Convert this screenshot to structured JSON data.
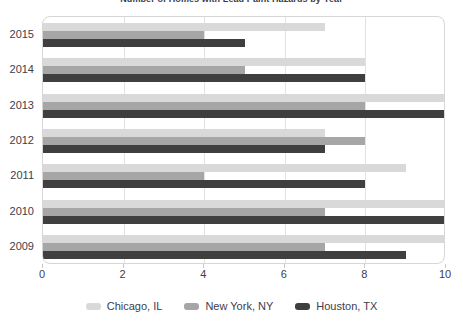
{
  "chart_data": {
    "type": "bar",
    "orientation": "horizontal",
    "title": "Number of Homes with Lead Paint Hazards by Year",
    "xlabel": "",
    "ylabel": "",
    "categories": [
      "2015",
      "2014",
      "2013",
      "2012",
      "2011",
      "2010",
      "2009"
    ],
    "series": [
      {
        "name": "Chicago, IL",
        "color": "#d9d9d9",
        "values": [
          7,
          8,
          10,
          7,
          9,
          10,
          10
        ]
      },
      {
        "name": "New York, NY",
        "color": "#a6a6a6",
        "values": [
          4,
          5,
          8,
          8,
          4,
          7,
          7
        ]
      },
      {
        "name": "Houston, TX",
        "color": "#3f3f3f",
        "values": [
          5,
          8,
          10,
          7,
          8,
          10,
          9
        ]
      }
    ],
    "xlim": [
      0,
      10
    ],
    "xticks": [
      0,
      2,
      4,
      6,
      8,
      10
    ],
    "xtick_labels": [
      "0",
      "2",
      "4",
      "6",
      "8",
      "10"
    ],
    "grid": true,
    "grid_axis": "x",
    "legend_position": "bottom"
  },
  "axis": {
    "x_tick_labels": [
      "0",
      "2",
      "4",
      "6",
      "8",
      "10"
    ],
    "y_tick_labels": [
      "2015",
      "2014",
      "2013",
      "2012",
      "2011",
      "2010",
      "2009"
    ]
  },
  "legend": {
    "items": [
      {
        "label": "Chicago, IL",
        "color": "#d9d9d9"
      },
      {
        "label": "New York, NY",
        "color": "#a6a6a6"
      },
      {
        "label": "Houston, TX",
        "color": "#3f3f3f"
      }
    ]
  },
  "colors": {
    "chicago": "#d9d9d9",
    "newyork": "#a6a6a6",
    "houston": "#3f3f3f",
    "grid": "#e2e2e2",
    "plot_border": "#d6d6d6",
    "text": "#3d3d4d"
  }
}
